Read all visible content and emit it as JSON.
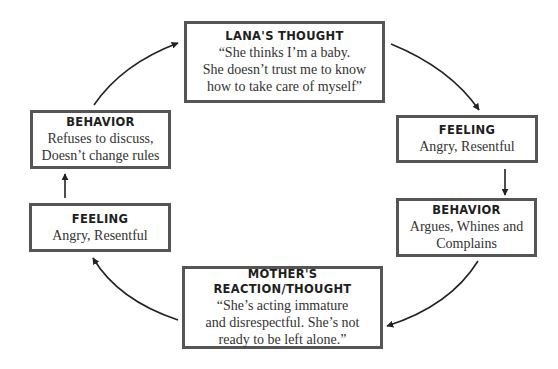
{
  "diagram": {
    "type": "cycle",
    "colors": {
      "border": "#555555",
      "text": "#2a2a2a",
      "arrow": "#222222",
      "background": "#ffffff"
    },
    "nodes": [
      {
        "id": "lanas-thought",
        "title": "LANA'S THOUGHT",
        "lines": [
          "“She thinks I’m a baby.",
          "She doesn’t trust me to know",
          "how to take care of myself”"
        ]
      },
      {
        "id": "feeling-right",
        "title": "FEELING",
        "lines": [
          "Angry, Resentful"
        ]
      },
      {
        "id": "behavior-right",
        "title": "BEHAVIOR",
        "lines": [
          "Argues, Whines and",
          "Complains"
        ]
      },
      {
        "id": "mothers-reaction",
        "title": "MOTHER'S REACTION/THOUGHT",
        "lines": [
          "“She’s acting immature",
          "and disrespectful. She’s not",
          "ready to be left alone.”"
        ]
      },
      {
        "id": "feeling-left",
        "title": "FEELING",
        "lines": [
          "Angry, Resentful"
        ]
      },
      {
        "id": "behavior-left",
        "title": "BEHAVIOR",
        "lines": [
          "Refuses to discuss,",
          "Doesn’t change rules"
        ]
      }
    ],
    "edges": [
      {
        "from": "lanas-thought",
        "to": "feeling-right"
      },
      {
        "from": "feeling-right",
        "to": "behavior-right"
      },
      {
        "from": "behavior-right",
        "to": "mothers-reaction"
      },
      {
        "from": "mothers-reaction",
        "to": "feeling-left"
      },
      {
        "from": "feeling-left",
        "to": "behavior-left"
      },
      {
        "from": "behavior-left",
        "to": "lanas-thought"
      }
    ]
  }
}
